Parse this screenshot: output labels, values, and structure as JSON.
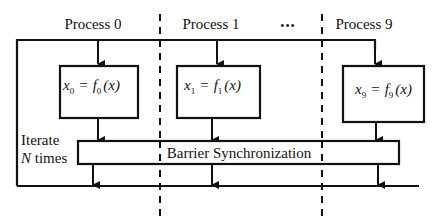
{
  "diagram": {
    "processes": [
      {
        "label": "Process 0",
        "equation": {
          "lhs": "x",
          "lhs_sub": "0",
          "op": "=",
          "fn": "f",
          "fn_sub": "0",
          "arg": "(x)"
        }
      },
      {
        "label": "Process 1",
        "equation": {
          "lhs": "x",
          "lhs_sub": "1",
          "op": "=",
          "fn": "f",
          "fn_sub": "1",
          "arg": "(x)"
        }
      },
      {
        "label": "Process 9",
        "equation": {
          "lhs": "x",
          "lhs_sub": "9",
          "op": "=",
          "fn": "f",
          "fn_sub": "9",
          "arg": "(x)"
        }
      }
    ],
    "ellipsis": "•••",
    "barrier_label": "Barrier Synchronization",
    "loop_label": {
      "line1": "Iterate",
      "line2_var": "N",
      "line2_rest": " times"
    },
    "colors": {
      "stroke": "#111111",
      "background": "#ffffff"
    }
  }
}
